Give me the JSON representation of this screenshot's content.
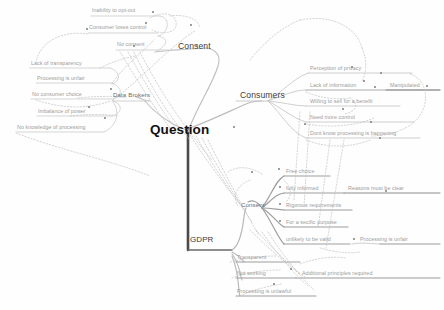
{
  "diagram": {
    "type": "mind-map",
    "title": "Question",
    "background_color": "#fefefe",
    "line_color": "#c9c9c9",
    "dotted_link_color": "#bdbdbd",
    "trunk_color": "#4a4a4a",
    "root": {
      "label": "Question",
      "x": 150,
      "y": 123
    },
    "trunk_label": {
      "label": "GDPR",
      "x": 190,
      "y": 238
    },
    "branches": [
      {
        "id": "consent-top",
        "label": "Consent",
        "class": "major",
        "x": 178,
        "y": 46,
        "children": [
          {
            "label": "Inability to opt-out",
            "x": 92,
            "y": 10
          },
          {
            "label": "Consumer loses control",
            "x": 89,
            "y": 27
          },
          {
            "label": "No consent",
            "x": 117,
            "y": 44
          }
        ]
      },
      {
        "id": "data-brokers",
        "label": "Data Brokers",
        "class": "mid",
        "x": 114,
        "y": 95,
        "children": [
          {
            "label": "Lack of transparency",
            "x": 32,
            "y": 62
          },
          {
            "label": "Processing is unfair",
            "x": 38,
            "y": 77
          },
          {
            "label": "No consumer choice",
            "x": 33,
            "y": 93
          },
          {
            "label": "Imbalance of power",
            "x": 39,
            "y": 110
          },
          {
            "label": "No knowledge of processing",
            "x": 18,
            "y": 126
          }
        ]
      },
      {
        "id": "consumers",
        "label": "Consumers",
        "class": "major",
        "x": 240,
        "y": 95,
        "children": [
          {
            "label": "Perception of privacy",
            "x": 310,
            "y": 67
          },
          {
            "label": "Lack of information",
            "x": 310,
            "y": 84
          },
          {
            "label": "Willing to sell for a benefit",
            "x": 310,
            "y": 100
          },
          {
            "label": "Need more control",
            "x": 310,
            "y": 116
          },
          {
            "label": "Dont know processing is happening",
            "x": 310,
            "y": 132
          }
        ],
        "grandchildren": [
          {
            "label": "Manipulated",
            "x": 390,
            "y": 84,
            "parent": "Lack of information"
          }
        ]
      },
      {
        "id": "consent-gdpr",
        "label": "Consent",
        "class": "mid",
        "x": 241,
        "y": 205,
        "children": [
          {
            "label": "Free choice",
            "x": 286,
            "y": 170
          },
          {
            "label": "fully informed",
            "x": 286,
            "y": 187
          },
          {
            "label": "Rigorous requirements",
            "x": 286,
            "y": 204
          },
          {
            "label": "For a secific purpose",
            "x": 286,
            "y": 221
          },
          {
            "label": "unlikely to be valid",
            "x": 286,
            "y": 238
          }
        ],
        "grandchildren": [
          {
            "label": "Reasons must be clear",
            "x": 348,
            "y": 187,
            "parent": "fully informed"
          },
          {
            "label": "Processing is unfair",
            "x": 360,
            "y": 238,
            "parent": "unlikely to be valid"
          }
        ]
      },
      {
        "id": "principles",
        "label": "",
        "class": "mid",
        "x": 0,
        "y": 0,
        "children": [
          {
            "label": "Transparent",
            "x": 237,
            "y": 256
          },
          {
            "label": "Not working",
            "x": 237,
            "y": 272
          },
          {
            "label": "Processing is unlawful",
            "x": 237,
            "y": 290
          }
        ],
        "grandchildren": [
          {
            "label": "Additional principles required",
            "x": 302,
            "y": 273,
            "parent": "Not working"
          }
        ]
      }
    ]
  }
}
